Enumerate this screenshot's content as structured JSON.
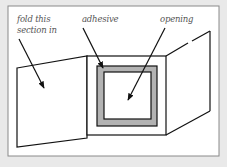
{
  "diagram": {
    "labels": {
      "fold_line1": "fold this",
      "fold_line2": "section in",
      "adhesive": "adhesive",
      "opening": "opening"
    },
    "colors": {
      "background": "#e9e9e9",
      "frame_fill": "#ffffff",
      "frame_stroke": "#888888",
      "line": "#111111",
      "adhesive": "#b3b3b3",
      "label_text": "#555555"
    }
  }
}
